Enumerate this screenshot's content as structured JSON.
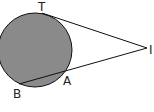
{
  "diagram": {
    "type": "circle-tangent-secant",
    "circle": {
      "cx": 35,
      "cy": 50,
      "r": 37,
      "fill": "#8a8a8a",
      "stroke": "#111111"
    },
    "points": {
      "T": {
        "label": "T",
        "x": 42,
        "y": 13
      },
      "I": {
        "label": "I",
        "x": 147,
        "y": 48
      },
      "A": {
        "label": "A",
        "x": 64,
        "y": 71
      },
      "B": {
        "label": "B",
        "x": 19,
        "y": 84
      }
    },
    "segments": [
      {
        "from": "T",
        "to": "I"
      },
      {
        "from": "I",
        "to": "B"
      }
    ]
  }
}
